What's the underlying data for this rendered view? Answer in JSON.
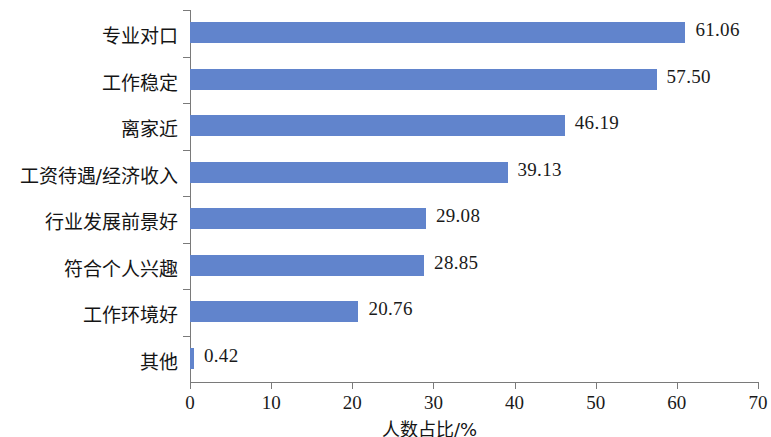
{
  "chart_data": {
    "type": "bar",
    "orientation": "horizontal",
    "title": "",
    "subtitle": "",
    "xlabel": "人数占比/%",
    "ylabel": "",
    "xlim": [
      0,
      70
    ],
    "xticks": [
      0,
      10,
      20,
      30,
      40,
      50,
      60,
      70
    ],
    "xtick_labels": [
      "0",
      "10",
      "20",
      "30",
      "40",
      "50",
      "60",
      "70"
    ],
    "grid": false,
    "legend": false,
    "bar_color": "#6184CC",
    "axis_color": "#7a7a7a",
    "value_label_format": "2-decimals",
    "categories": [
      "专业对口",
      "工作稳定",
      "离家近",
      "工资待遇/经济收入",
      "行业发展前景好",
      "符合个人兴趣",
      "工作环境好",
      "其他"
    ],
    "values": [
      61.06,
      57.5,
      46.19,
      39.13,
      29.08,
      28.85,
      20.76,
      0.42
    ],
    "value_labels": [
      "61.06",
      "57.50",
      "46.19",
      "39.13",
      "29.08",
      "28.85",
      "20.76",
      "0.42"
    ]
  }
}
